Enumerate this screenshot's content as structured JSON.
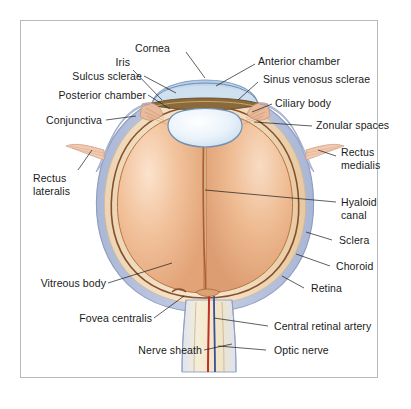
{
  "figure": {
    "frame_color": "#b9b9b9",
    "background": "#ffffff"
  },
  "palette": {
    "sclera": "#b9c4dd",
    "sclera_edge": "#8e9cbd",
    "choroid": "#f0dcc0",
    "choroid_deep": "#e0c49b",
    "retina": "#8a4f2a",
    "vitreous": "#e9b184",
    "vitreous_light": "#f6d5b6",
    "cornea": "#c6d9ec",
    "cornea_edge": "#7d9cc0",
    "lens": "#e8f2fa",
    "iris": "#8a6a3a",
    "ciliary": "#e8b99a",
    "muscle": "#e9b79a",
    "artery": "#c0302b",
    "vein": "#3a4f9b",
    "nerve": "#f2e6c8",
    "leader": "#1a1a1a",
    "text": "#1a1a1a"
  },
  "labels": {
    "cornea": "Cornea",
    "iris": "Iris",
    "sulcus_sclerae": "Sulcus sclerae",
    "posterior_chamber": "Posterior chamber",
    "conjunctiva": "Conjunctiva",
    "rectus_lateralis_line1": "Rectus",
    "rectus_lateralis_line2": "lateralis",
    "vitreous_body": "Vitreous body",
    "fovea_centralis": "Fovea centralis",
    "nerve_sheath": "Nerve sheath",
    "anterior_chamber": "Anterior chamber",
    "sinus_venosus_sclerae": "Sinus venosus sclerae",
    "ciliary_body": "Ciliary body",
    "zonular_spaces": "Zonular spaces",
    "rectus_medialis_line1": "Rectus",
    "rectus_medialis_line2": "medialis",
    "hyaloid_canal_line1": "Hyaloid",
    "hyaloid_canal_line2": "canal",
    "sclera": "Sclera",
    "choroid": "Choroid",
    "retina": "Retina",
    "central_retinal_artery": "Central retinal artery",
    "optic_nerve": "Optic nerve"
  }
}
